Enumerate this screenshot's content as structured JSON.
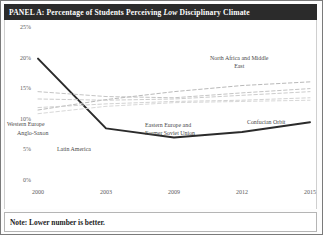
{
  "header": {
    "panel_prefix": "PANEL A: Percentage of Students Perceiving ",
    "emphasis": "Low",
    "panel_suffix": " Disciplinary Climate",
    "full_title": "PANEL A: Percentage of Students Perceiving Low Disciplinary Climate",
    "background_color": "#2b2b2b",
    "text_color": "#ffffff"
  },
  "footer": {
    "note": "Note: Lower number is better."
  },
  "axis": {
    "y_ticks": [
      "25%",
      "20%",
      "15%",
      "10%",
      "5%",
      "0%"
    ],
    "x_ticks": [
      "2000",
      "2003",
      "2009",
      "2012",
      "2015"
    ]
  },
  "series_labels": [
    {
      "text": "Western Europe"
    },
    {
      "text": "Anglo-Saxon"
    },
    {
      "text": "Latin America"
    },
    {
      "text": "North Africa and Middle\nEast"
    },
    {
      "text": "Eastern Europe and\nFormer Soviet Union"
    },
    {
      "text": "Confucian Orbit"
    }
  ],
  "chart_data": {
    "type": "line",
    "title": "PANEL A: Percentage of Students Perceiving Low Disciplinary Climate",
    "xlabel": "",
    "ylabel": "",
    "x": [
      "2000",
      "2003",
      "2009",
      "2012",
      "2015"
    ],
    "ylim": [
      0,
      25
    ],
    "y_tick_values": [
      0,
      5,
      10,
      15,
      20,
      25
    ],
    "y_tick_labels": [
      "0%",
      "5%",
      "10%",
      "15%",
      "20%",
      "25%"
    ],
    "grid": false,
    "legend": "inline-annotations",
    "note": "Lower number is better.",
    "series": [
      {
        "name": "Confucian Orbit",
        "style": "solid",
        "color": "#2b2b2b",
        "width": 2.0,
        "values": [
          20.0,
          8.6,
          7.1,
          8.0,
          9.6
        ]
      },
      {
        "name": "North Africa and Middle East",
        "style": "dashed",
        "color": "#b9b9b9",
        "width": 1.0,
        "values": [
          11.6,
          13.3,
          14.6,
          15.6,
          16.2
        ]
      },
      {
        "name": "Western Europe",
        "style": "dashed",
        "color": "#c4c4c4",
        "width": 1.0,
        "values": [
          14.6,
          13.8,
          13.6,
          14.4,
          15.1
        ]
      },
      {
        "name": "Anglo-Saxon",
        "style": "dashed",
        "color": "#cccccc",
        "width": 1.0,
        "values": [
          13.4,
          13.2,
          13.4,
          14.0,
          14.6
        ]
      },
      {
        "name": "Eastern Europe and Former Soviet Union",
        "style": "dashed",
        "color": "#d2d2d2",
        "width": 1.0,
        "values": [
          12.0,
          12.6,
          13.0,
          13.2,
          13.6
        ]
      },
      {
        "name": "Latin America",
        "style": "dashed",
        "color": "#d8d8d8",
        "width": 1.0,
        "values": [
          11.0,
          12.2,
          12.8,
          13.0,
          13.2
        ]
      }
    ]
  }
}
